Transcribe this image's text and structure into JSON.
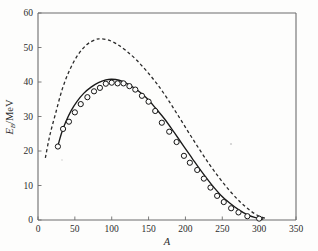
{
  "figure": {
    "background_color": "#fdfdfc",
    "plot_box": {
      "left": 38,
      "top": 13,
      "right": 296,
      "bottom": 220
    }
  },
  "chart_data": {
    "type": "line",
    "title": "",
    "subtitle": "",
    "xlabel": "A",
    "ylabel": "E_B/MeV",
    "ylabel_parts": {
      "symbol": "E",
      "subscript": "B",
      "unit": "/MeV"
    },
    "xlim": [
      0,
      350
    ],
    "ylim": [
      0,
      60
    ],
    "xticks": [
      0,
      50,
      100,
      150,
      200,
      250,
      300,
      350
    ],
    "xticklabels": [
      "0",
      "50",
      "100",
      "150",
      "200",
      "250",
      "300",
      "350"
    ],
    "yticks": [
      0,
      10,
      20,
      30,
      40,
      50,
      60
    ],
    "yticklabels": [
      "0",
      "10",
      "20",
      "30",
      "40",
      "50",
      "60"
    ],
    "grid": false,
    "legend": null,
    "series": [
      {
        "name": "semi-empirical fit (solid)",
        "style": "solid",
        "color": "#1a1a1a",
        "x": [
          27,
          32,
          38,
          45,
          53,
          62,
          72,
          82,
          92,
          100,
          110,
          122,
          135,
          148,
          160,
          172,
          185,
          198,
          210,
          222,
          235,
          248,
          260,
          272,
          285,
          295,
          305
        ],
        "y": [
          21.5,
          25.2,
          28.6,
          31.7,
          34.4,
          36.7,
          38.5,
          39.8,
          40.6,
          40.8,
          40.5,
          39.4,
          37.6,
          35.2,
          32.3,
          29.2,
          25.3,
          21.3,
          17.6,
          14.0,
          10.4,
          7.2,
          4.9,
          3.0,
          1.4,
          0.7,
          0.3
        ]
      },
      {
        "name": "liquid-drop volume+surface term (dashed)",
        "style": "dashed",
        "color": "#2a2a2a",
        "x": [
          10,
          16,
          24,
          33,
          43,
          54,
          66,
          78,
          85,
          95,
          107,
          120,
          134,
          148,
          162,
          176,
          190,
          204,
          218,
          232,
          246,
          260,
          274,
          288,
          300,
          310
        ],
        "y": [
          18.0,
          24.5,
          31.0,
          38.0,
          43.5,
          47.8,
          50.8,
          52.3,
          52.5,
          52.2,
          51.0,
          49.0,
          46.3,
          43.0,
          39.3,
          35.0,
          30.3,
          25.5,
          20.8,
          16.3,
          12.2,
          8.5,
          5.3,
          2.7,
          1.1,
          0.4
        ]
      }
    ],
    "markers": {
      "name": "measured nuclei",
      "shape": "circle",
      "fill": "#fdfdfc",
      "edge_color": "#141414",
      "radius_px": 2.6,
      "points": [
        {
          "x": 27,
          "y": 21.3
        },
        {
          "x": 34,
          "y": 26.4
        },
        {
          "x": 42,
          "y": 28.5
        },
        {
          "x": 50,
          "y": 31.2
        },
        {
          "x": 58,
          "y": 33.6
        },
        {
          "x": 67,
          "y": 35.6
        },
        {
          "x": 76,
          "y": 37.3
        },
        {
          "x": 84,
          "y": 38.3
        },
        {
          "x": 92,
          "y": 39.5
        },
        {
          "x": 100,
          "y": 39.8
        },
        {
          "x": 108,
          "y": 39.6
        },
        {
          "x": 116,
          "y": 39.6
        },
        {
          "x": 124,
          "y": 38.8
        },
        {
          "x": 132,
          "y": 37.8
        },
        {
          "x": 141,
          "y": 36.0
        },
        {
          "x": 150,
          "y": 34.3
        },
        {
          "x": 159,
          "y": 31.6
        },
        {
          "x": 168,
          "y": 28.2
        },
        {
          "x": 178,
          "y": 25.6
        },
        {
          "x": 188,
          "y": 22.6
        },
        {
          "x": 198,
          "y": 18.6
        },
        {
          "x": 206,
          "y": 16.6
        },
        {
          "x": 216,
          "y": 14.5
        },
        {
          "x": 225,
          "y": 12.0
        },
        {
          "x": 234,
          "y": 9.4
        },
        {
          "x": 243,
          "y": 7.0
        },
        {
          "x": 252,
          "y": 5.2
        },
        {
          "x": 262,
          "y": 3.4
        },
        {
          "x": 272,
          "y": 2.2
        },
        {
          "x": 284,
          "y": 1.1
        },
        {
          "x": 300,
          "y": 0.4
        }
      ]
    }
  }
}
